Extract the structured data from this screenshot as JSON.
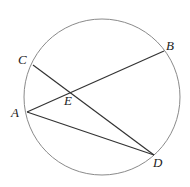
{
  "diagram": {
    "type": "circle-chords",
    "circle": {
      "cx": 102,
      "cy": 97,
      "r": 78,
      "stroke": "#8a8a8a"
    },
    "points": {
      "A": {
        "label": "A",
        "x": 27,
        "y": 112
      },
      "B": {
        "label": "B",
        "x": 164,
        "y": 51
      },
      "C": {
        "label": "C",
        "x": 33,
        "y": 65
      },
      "D": {
        "label": "D",
        "x": 154,
        "y": 155
      },
      "E": {
        "label": "E",
        "x": 71,
        "y": 92
      }
    },
    "segments": [
      {
        "name": "AB",
        "from": "A",
        "to": "B"
      },
      {
        "name": "CD",
        "from": "C",
        "to": "D"
      },
      {
        "name": "AD",
        "from": "A",
        "to": "D"
      }
    ],
    "line_color": "#333333"
  }
}
